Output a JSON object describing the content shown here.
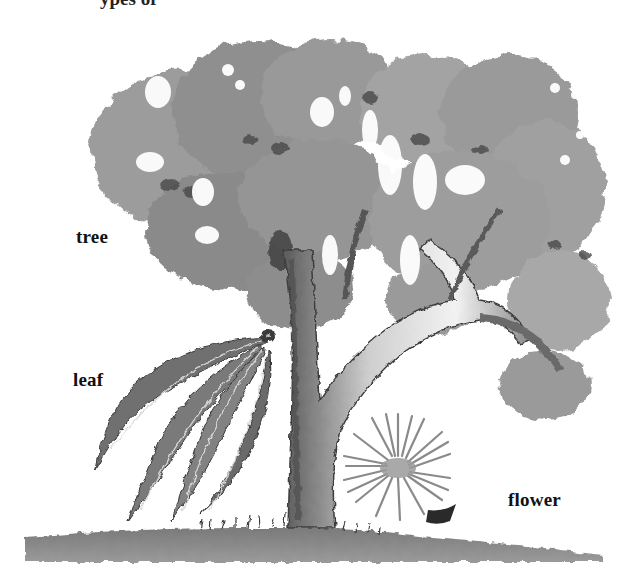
{
  "figure": {
    "type": "labeled-illustration",
    "style": "grayscale watercolor",
    "background": "#ffffff",
    "top_cropped_text": "ypes of"
  },
  "labels": [
    {
      "id": "tree",
      "text": "tree",
      "x": 76,
      "y": 227
    },
    {
      "id": "leaf",
      "text": "leaf",
      "x": 73,
      "y": 370
    },
    {
      "id": "flower",
      "text": "flower",
      "x": 508,
      "y": 490
    }
  ],
  "colors": {
    "foliage_light": "#a9a9a9",
    "foliage_mid": "#8a8a8a",
    "foliage_dark": "#5a5a5a",
    "trunk_light": "#eeeeee",
    "trunk_shadow": "#6e6e6e",
    "leaf_fill": "#6f6f6f",
    "leaf_vein": "#d8d8d8",
    "ground": "#8c8c8c",
    "flower_stroke": "#8a8a8a",
    "flower_center": "#9a9a9a",
    "label_text": "#111111"
  }
}
